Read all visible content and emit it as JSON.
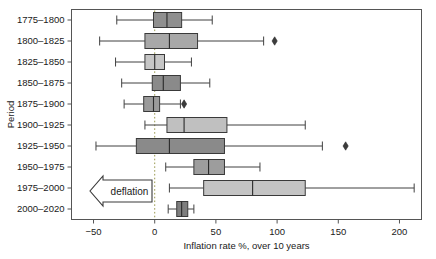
{
  "chart_data": {
    "type": "box",
    "title": "",
    "xlabel": "Inflation rate %, over 10 years",
    "ylabel": "Period",
    "xlim": [
      -68,
      218
    ],
    "xticks": [
      -50,
      0,
      50,
      100,
      150,
      200
    ],
    "xtick_labels": [
      "−50",
      "0",
      "50",
      "100",
      "150",
      "200"
    ],
    "grid": false,
    "legend": "none",
    "orientation": "horizontal",
    "zero_reference_line": 0,
    "annotations": [
      {
        "name": "deflation-arrow",
        "text": "deflation",
        "direction": "left"
      }
    ],
    "categories": [
      "1775–1800",
      "1800–1825",
      "1825–1850",
      "1850–1875",
      "1875–1900",
      "1900–1925",
      "1925–1950",
      "1950–1975",
      "1975–2000",
      "2000–2020"
    ],
    "boxes": [
      {
        "category": "1775–1800",
        "whisker_low": -31,
        "q1": -1,
        "median": 10,
        "q3": 22,
        "whisker_high": 47,
        "outliers": [],
        "fill": "#8f8f8f"
      },
      {
        "category": "1800–1825",
        "whisker_low": -45,
        "q1": -8,
        "median": 12,
        "q3": 35,
        "whisker_high": 89,
        "outliers": [
          98
        ],
        "fill": "#a8a8a8"
      },
      {
        "category": "1825–1850",
        "whisker_low": -32,
        "q1": -8,
        "median": 0,
        "q3": 8,
        "whisker_high": 30,
        "outliers": [],
        "fill": "#c6c6c6"
      },
      {
        "category": "1850–1875",
        "whisker_low": -27,
        "q1": -2,
        "median": 7,
        "q3": 21,
        "whisker_high": 45,
        "outliers": [],
        "fill": "#8a8a8a"
      },
      {
        "category": "1875–1900",
        "whisker_low": -25,
        "q1": -9,
        "median": -1,
        "q3": 4,
        "whisker_high": 21,
        "outliers": [
          24
        ],
        "fill": "#9a9a9a"
      },
      {
        "category": "1900–1925",
        "whisker_low": -8,
        "q1": 10,
        "median": 24,
        "q3": 59,
        "whisker_high": 123,
        "outliers": [],
        "fill": "#c0c0c0"
      },
      {
        "category": "1925–1950",
        "whisker_low": -48,
        "q1": -15,
        "median": 12,
        "q3": 57,
        "whisker_high": 137,
        "outliers": [
          156
        ],
        "fill": "#8a8a8a"
      },
      {
        "category": "1950–1975",
        "whisker_low": 9,
        "q1": 32,
        "median": 44,
        "q3": 57,
        "whisker_high": 86,
        "outliers": [],
        "fill": "#9d9d9d"
      },
      {
        "category": "1975–2000",
        "whisker_low": 12,
        "q1": 40,
        "median": 80,
        "q3": 123,
        "whisker_high": 212,
        "outliers": [],
        "fill": "#c4c4c4"
      },
      {
        "category": "2000–2020",
        "whisker_low": 11,
        "q1": 18,
        "median": 22,
        "q3": 27,
        "whisker_high": 32,
        "outliers": [],
        "fill": "#7e7e7e"
      }
    ]
  },
  "figure": {
    "background": "#ffffff",
    "frame_color": "#555555",
    "zero_line_color": "#9a9a50"
  }
}
